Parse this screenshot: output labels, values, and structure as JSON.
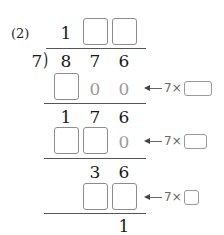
{
  "problem_label": "(2)",
  "divisor": "7",
  "bracket": ")",
  "quotient": {
    "digits": [
      "1"
    ],
    "blanks": 2
  },
  "dividend": [
    "8",
    "7",
    "6"
  ],
  "steps": [
    {
      "row": "product",
      "cells": [
        "[ ]",
        "0",
        "0"
      ],
      "annotation": {
        "arrow": "←",
        "text": "7×",
        "blank": "[ ]"
      }
    },
    {
      "row": "remainder",
      "cells": [
        "1",
        "7",
        "6"
      ]
    },
    {
      "row": "product",
      "cells": [
        "[ ]",
        "[ ]",
        "0"
      ],
      "annotation": {
        "arrow": "←",
        "text": "7×",
        "blank": "[ ]"
      }
    },
    {
      "row": "remainder",
      "cells": [
        "3",
        "6"
      ]
    },
    {
      "row": "product",
      "cells": [
        "[ ]",
        "[ ]"
      ],
      "annotation": {
        "arrow": "←",
        "text": "7×",
        "blank": "[ ]"
      }
    },
    {
      "row": "remainder",
      "cells": [
        "1"
      ]
    }
  ],
  "text": {
    "q1": "1",
    "d1": "8",
    "d2": "7",
    "d3": "6",
    "r1_c2": "0",
    "r1_c3": "0",
    "r2_c1": "1",
    "r2_c2": "7",
    "r2_c3": "6",
    "r3_c3": "0",
    "r4_c2": "3",
    "r4_c3": "6",
    "r5_c3": "1",
    "ann_text": "7×"
  },
  "colors": {
    "text": "#1a1a1a",
    "hint_digits": "#9a9a9a",
    "box_border": "#8c8c8c",
    "rule": "#555555"
  }
}
